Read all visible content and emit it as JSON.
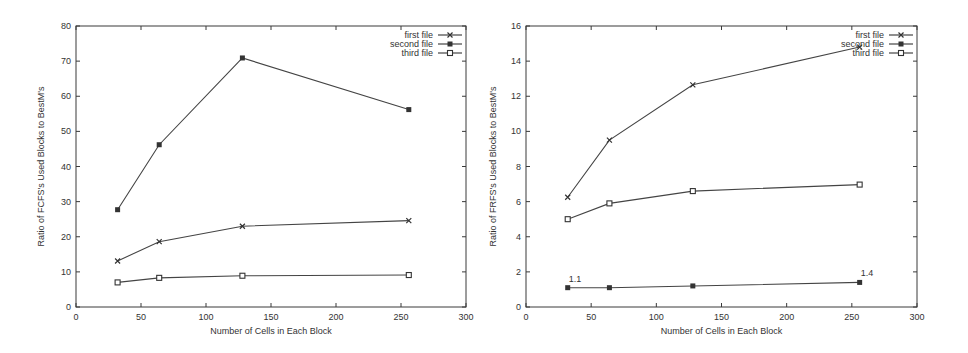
{
  "chart_data": [
    {
      "type": "line",
      "title": "",
      "xlabel": "Number of Cells in Each Block",
      "ylabel": "Ratio of FCFS's Used Blocks to BestM's",
      "xlim": [
        0,
        300
      ],
      "ylim": [
        0,
        80
      ],
      "xticks": [
        0,
        50,
        100,
        150,
        200,
        250,
        300
      ],
      "yticks": [
        0,
        10,
        20,
        30,
        40,
        50,
        60,
        70,
        80
      ],
      "grid": false,
      "legend_position": "top-right",
      "x": [
        32,
        64,
        128,
        256
      ],
      "series": [
        {
          "name": "first file",
          "marker": "x",
          "values": [
            13.1,
            18.6,
            23.0,
            24.6
          ]
        },
        {
          "name": "second file",
          "marker": "filled-square",
          "values": [
            27.7,
            46.2,
            70.9,
            56.2
          ]
        },
        {
          "name": "third file",
          "marker": "hollow-square",
          "values": [
            7.0,
            8.3,
            8.9,
            9.1
          ]
        }
      ],
      "annotations": []
    },
    {
      "type": "line",
      "title": "",
      "xlabel": "Number of Cells in Each Block",
      "ylabel": "Ratio of FRFS's Used Blocks to BestM's",
      "xlim": [
        0,
        300
      ],
      "ylim": [
        0,
        16
      ],
      "xticks": [
        0,
        50,
        100,
        150,
        200,
        250,
        300
      ],
      "yticks": [
        0,
        2,
        4,
        6,
        8,
        10,
        12,
        14,
        16
      ],
      "grid": false,
      "legend_position": "top-right",
      "x": [
        32,
        64,
        128,
        256
      ],
      "series": [
        {
          "name": "first file",
          "marker": "x",
          "values": [
            6.25,
            9.5,
            12.65,
            14.8
          ]
        },
        {
          "name": "second file",
          "marker": "filled-square",
          "values": [
            1.1,
            1.1,
            1.2,
            1.4
          ]
        },
        {
          "name": "third file",
          "marker": "hollow-square",
          "values": [
            5.0,
            5.9,
            6.6,
            6.97
          ]
        }
      ],
      "annotations": [
        {
          "text": "1.1",
          "x": 32,
          "y": 1.1
        },
        {
          "text": "1.4",
          "x": 256,
          "y": 1.4
        }
      ]
    }
  ],
  "colors": {
    "line": "#444444",
    "axis": "#3a3a3a",
    "background": "#ffffff"
  }
}
